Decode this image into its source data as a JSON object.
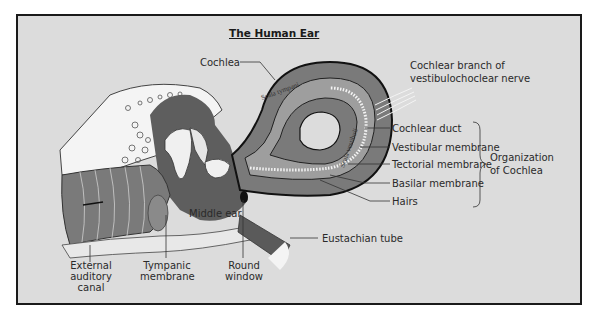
{
  "title": "The Human Ear",
  "labels": {
    "cochlea": "Cochlea",
    "cochlear_branch_line1": "Cochlear branch of",
    "cochlear_branch_line2": "vestibulochoclear nerve",
    "cochlear_duct": "Cochlear duct",
    "vestibular_membrane": "Vestibular membrane",
    "tectorial_membrane": "Tectorial membrane",
    "basilar_membrane": "Basilar membrane",
    "hairs": "Hairs",
    "organization_line1": "Organization",
    "organization_line2": "of Cochlea",
    "middle_ear": "Middle ear",
    "eustachian_tube": "Eustachian tube",
    "external_line1": "External",
    "external_line2": "auditory",
    "external_line3": "canal",
    "tympanic_line1": "Tympanic",
    "tympanic_line2": "membrane",
    "round_line1": "Round",
    "round_line2": "window",
    "scala_tympani": "Scala tympani",
    "scala_vestibuli": "Scala vestibuli"
  },
  "colors": {
    "background": "#dcdcdc",
    "border": "#1a1a1a",
    "tissue_dark": "#6e6e6e",
    "tissue_mid": "#9a9a9a",
    "bone_light": "#f4f4f4"
  }
}
